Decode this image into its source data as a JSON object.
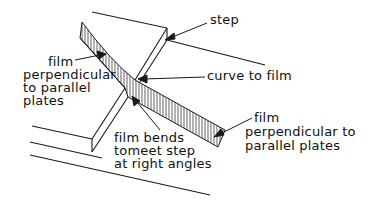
{
  "diagram": {
    "labels": {
      "step": "step",
      "curve": "curve to film",
      "film_left": [
        "film",
        "perpendicular",
        "to parallel",
        "plates"
      ],
      "film_bends": [
        "film bends",
        "tomeet step",
        "at right angles"
      ],
      "film_right": [
        "film",
        "perpendicular to",
        "parallel plates"
      ]
    },
    "colors": {
      "line": "#1a1a1a",
      "background": "#ffffff"
    }
  }
}
